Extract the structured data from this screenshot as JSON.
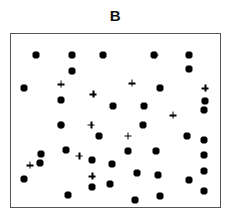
{
  "chart_data": {
    "type": "scatter",
    "title": "B",
    "xlabel": "",
    "ylabel": "",
    "xlim": [
      0,
      100
    ],
    "ylim": [
      0,
      100
    ],
    "grid": false,
    "axis_ticks": false,
    "legend": "none",
    "frame_color": "#555555",
    "marker_color": "#000000",
    "series": [
      {
        "name": "dot",
        "marker": "filled-dot",
        "count": 38,
        "points": [
          [
            11.8,
            88.0
          ],
          [
            29.4,
            88.0
          ],
          [
            44.1,
            88.0
          ],
          [
            68.2,
            88.0
          ],
          [
            85.3,
            88.0
          ],
          [
            29.4,
            78.9
          ],
          [
            85.3,
            80.0
          ],
          [
            6.2,
            68.6
          ],
          [
            71.1,
            68.6
          ],
          [
            23.7,
            61.7
          ],
          [
            92.9,
            61.1
          ],
          [
            48.8,
            58.3
          ],
          [
            63.5,
            58.3
          ],
          [
            92.4,
            56.0
          ],
          [
            23.7,
            47.4
          ],
          [
            63.0,
            47.4
          ],
          [
            42.2,
            41.1
          ],
          [
            84.4,
            41.1
          ],
          [
            92.4,
            38.9
          ],
          [
            26.1,
            33.1
          ],
          [
            55.9,
            32.6
          ],
          [
            69.2,
            32.6
          ],
          [
            92.4,
            30.3
          ],
          [
            13.7,
            25.7
          ],
          [
            14.2,
            30.9
          ],
          [
            38.9,
            26.9
          ],
          [
            48.3,
            25.1
          ],
          [
            6.2,
            16.0
          ],
          [
            38.9,
            11.4
          ],
          [
            60.2,
            19.4
          ],
          [
            70.1,
            18.3
          ],
          [
            27.5,
            6.9
          ],
          [
            71.1,
            6.3
          ],
          [
            92.4,
            9.1
          ],
          [
            47.4,
            13.1
          ],
          [
            85.3,
            15.4
          ],
          [
            59.2,
            4.0
          ],
          [
            92.4,
            21.1
          ]
        ]
      },
      {
        "name": "plus",
        "marker": "plus",
        "count": 12,
        "points": [
          [
            68.7,
            88.0
          ],
          [
            23.7,
            70.9
          ],
          [
            57.8,
            71.4
          ],
          [
            92.9,
            68.6
          ],
          [
            39.3,
            65.1
          ],
          [
            77.3,
            53.1
          ],
          [
            23.7,
            47.4
          ],
          [
            38.4,
            47.4
          ],
          [
            55.9,
            41.1
          ],
          [
            32.7,
            29.7
          ],
          [
            9.0,
            24.0
          ],
          [
            38.9,
            17.7
          ]
        ]
      }
    ]
  }
}
